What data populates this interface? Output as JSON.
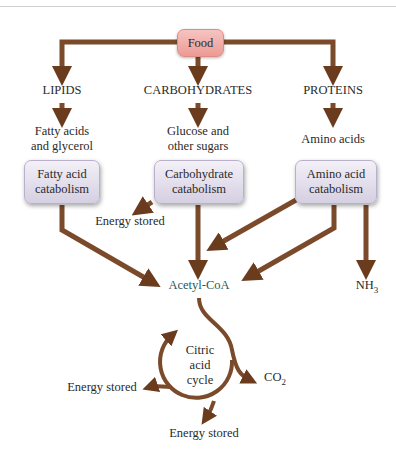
{
  "colors": {
    "arrow": "#7a4a2a",
    "arrow_light": "#b07a50",
    "food_box": "#ef a8a3",
    "catabolism_box": "#e2dcec",
    "acetyl_text": "#1f5a5a"
  },
  "root": {
    "label": "Food"
  },
  "categories": [
    {
      "name": "LIPIDS",
      "product": [
        "Fatty acids",
        "and glycerol"
      ],
      "process": [
        "Fatty acid",
        "catabolism"
      ]
    },
    {
      "name": "CARBOHYDRATES",
      "product": [
        "Glucose and",
        "other sugars"
      ],
      "process": [
        "Carbohydrate",
        "catabolism"
      ]
    },
    {
      "name": "PROTEINS",
      "product": [
        "Amino acids"
      ],
      "process": [
        "Amino acid",
        "catabolism"
      ]
    }
  ],
  "outputs": {
    "carb_energy": "Energy stored",
    "acetyl": "Acetyl-CoA",
    "nh3": "NH",
    "nh3_sub": "3"
  },
  "cycle": {
    "label": [
      "Citric",
      "acid",
      "cycle"
    ],
    "co2": "CO",
    "co2_sub": "2",
    "energy_left": "Energy stored",
    "energy_bottom": "Energy stored"
  }
}
